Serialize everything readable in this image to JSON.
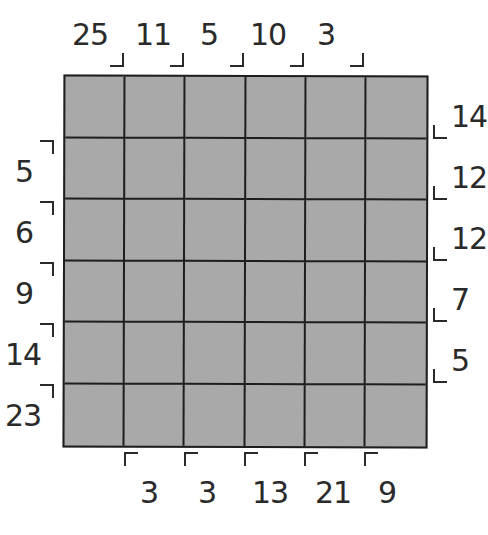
{
  "puzzle": {
    "rows": 6,
    "cols": 6,
    "cell_color": "#a9a9a9",
    "line_color": "#1e1e1e",
    "clues": {
      "top": [
        "25",
        "11",
        "5",
        "10",
        "3"
      ],
      "left": [
        "5",
        "6",
        "9",
        "14",
        "23"
      ],
      "right": [
        "14",
        "12",
        "12",
        "7",
        "5"
      ],
      "bottom": [
        "3",
        "3",
        "13",
        "21",
        "9"
      ]
    }
  }
}
